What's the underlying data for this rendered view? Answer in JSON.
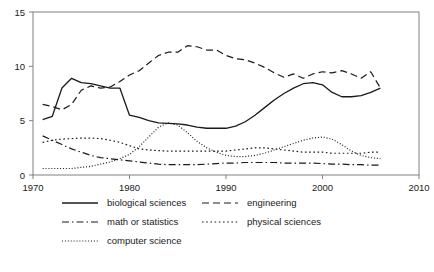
{
  "chart_data": {
    "type": "line",
    "title": "",
    "xlabel": "",
    "ylabel": "",
    "xlim": [
      1970,
      2010
    ],
    "ylim": [
      0,
      15
    ],
    "xticks": [
      1970,
      1980,
      1990,
      2000,
      2010
    ],
    "yticks": [
      0,
      5,
      10,
      15
    ],
    "xtick_labels": [
      "1970",
      "1980",
      "1990",
      "2000",
      "2010"
    ],
    "ytick_labels": [
      "0",
      "5",
      "10",
      "15"
    ],
    "grid": false,
    "legend_position": "below-center",
    "series": [
      {
        "name": "biological sciences",
        "style": "solid",
        "x": [
          1971,
          1972,
          1973,
          1974,
          1975,
          1976,
          1977,
          1978,
          1979,
          1980,
          1981,
          1982,
          1983,
          1984,
          1985,
          1986,
          1987,
          1988,
          1989,
          1990,
          1991,
          1992,
          1993,
          1994,
          1995,
          1996,
          1997,
          1998,
          1999,
          2000,
          2001,
          2002,
          2003,
          2004,
          2005,
          2006
        ],
        "values": [
          5.1,
          5.4,
          8.0,
          8.9,
          8.5,
          8.4,
          8.2,
          8.0,
          8.0,
          5.5,
          5.3,
          5.0,
          4.8,
          4.75,
          4.7,
          4.6,
          4.4,
          4.3,
          4.3,
          4.3,
          4.5,
          4.9,
          5.5,
          6.2,
          6.9,
          7.5,
          8.0,
          8.4,
          8.5,
          8.3,
          7.6,
          7.2,
          7.2,
          7.3,
          7.6,
          8.0
        ]
      },
      {
        "name": "engineering",
        "style": "dashed",
        "x": [
          1971,
          1972,
          1973,
          1974,
          1975,
          1976,
          1977,
          1978,
          1979,
          1980,
          1981,
          1982,
          1983,
          1984,
          1985,
          1986,
          1987,
          1988,
          1989,
          1990,
          1991,
          1992,
          1993,
          1994,
          1995,
          1996,
          1997,
          1998,
          1999,
          2000,
          2001,
          2002,
          2003,
          2004,
          2005,
          2006
        ],
        "values": [
          6.5,
          6.3,
          6.0,
          6.5,
          7.8,
          8.2,
          8.0,
          8.1,
          8.6,
          9.2,
          9.6,
          10.3,
          11.0,
          11.3,
          11.3,
          11.9,
          11.8,
          11.5,
          11.5,
          11.0,
          10.7,
          10.6,
          10.3,
          9.9,
          9.4,
          9.0,
          9.3,
          8.9,
          9.3,
          9.5,
          9.4,
          9.6,
          9.3,
          8.9,
          9.5,
          8.0
        ]
      },
      {
        "name": "math or statistics",
        "style": "dashdot",
        "x": [
          1971,
          1972,
          1973,
          1974,
          1975,
          1976,
          1977,
          1978,
          1979,
          1980,
          1981,
          1982,
          1983,
          1984,
          1985,
          1986,
          1987,
          1988,
          1989,
          1990,
          1991,
          1992,
          1993,
          1994,
          1995,
          1996,
          1997,
          1998,
          1999,
          2000,
          2001,
          2002,
          2003,
          2004,
          2005,
          2006
        ],
        "values": [
          3.6,
          3.2,
          2.8,
          2.4,
          2.1,
          1.8,
          1.6,
          1.5,
          1.4,
          1.3,
          1.2,
          1.1,
          1.0,
          0.95,
          0.95,
          0.95,
          0.95,
          1.0,
          1.05,
          1.1,
          1.1,
          1.15,
          1.15,
          1.15,
          1.15,
          1.1,
          1.1,
          1.1,
          1.1,
          1.05,
          1.0,
          1.0,
          0.95,
          0.95,
          0.9,
          0.9
        ]
      },
      {
        "name": "physical sciences",
        "style": "dotted",
        "x": [
          1971,
          1972,
          1973,
          1974,
          1975,
          1976,
          1977,
          1978,
          1979,
          1980,
          1981,
          1982,
          1983,
          1984,
          1985,
          1986,
          1987,
          1988,
          1989,
          1990,
          1991,
          1992,
          1993,
          1994,
          1995,
          1996,
          1997,
          1998,
          1999,
          2000,
          2001,
          2002,
          2003,
          2004,
          2005,
          2006
        ],
        "values": [
          3.0,
          3.2,
          3.3,
          3.35,
          3.4,
          3.4,
          3.35,
          3.2,
          3.0,
          2.7,
          2.4,
          2.3,
          2.25,
          2.2,
          2.2,
          2.2,
          2.2,
          2.2,
          2.2,
          2.2,
          2.3,
          2.4,
          2.5,
          2.5,
          2.4,
          2.3,
          2.2,
          2.1,
          2.1,
          2.1,
          2.0,
          2.0,
          2.0,
          2.0,
          2.1,
          2.1
        ]
      },
      {
        "name": "computer science",
        "style": "finedot",
        "x": [
          1971,
          1972,
          1973,
          1974,
          1975,
          1976,
          1977,
          1978,
          1979,
          1980,
          1981,
          1982,
          1983,
          1984,
          1985,
          1986,
          1987,
          1988,
          1989,
          1990,
          1991,
          1992,
          1993,
          1994,
          1995,
          1996,
          1997,
          1998,
          1999,
          2000,
          2001,
          2002,
          2003,
          2004,
          2005,
          2006
        ],
        "values": [
          0.6,
          0.6,
          0.6,
          0.6,
          0.7,
          0.8,
          1.0,
          1.2,
          1.5,
          1.9,
          2.6,
          3.5,
          4.4,
          4.8,
          4.6,
          3.9,
          3.1,
          2.5,
          2.1,
          1.8,
          1.7,
          1.7,
          1.8,
          2.0,
          2.3,
          2.6,
          2.9,
          3.2,
          3.4,
          3.5,
          3.3,
          2.8,
          2.2,
          1.8,
          1.6,
          1.5
        ]
      }
    ]
  },
  "legend": {
    "entries": [
      {
        "label": "biological sciences",
        "style": "solid"
      },
      {
        "label": "engineering",
        "style": "dashed"
      },
      {
        "label": "math or statistics",
        "style": "dashdot"
      },
      {
        "label": "physical sciences",
        "style": "dotted"
      },
      {
        "label": "computer science",
        "style": "finedot"
      }
    ]
  },
  "caption": {
    "text": ""
  },
  "colors": {
    "line": "#1a1a1a",
    "axis": "#808080",
    "background": "#ffffff"
  }
}
